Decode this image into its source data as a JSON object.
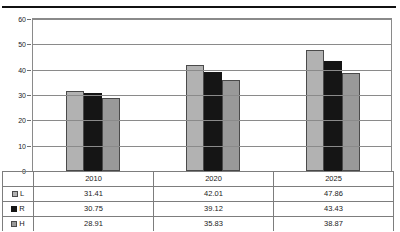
{
  "chart_data": {
    "type": "bar",
    "title": "",
    "subtitle": "",
    "xlabel": "",
    "ylabel": "",
    "categories": [
      "2010",
      "2020",
      "2025"
    ],
    "series": [
      {
        "name": "L",
        "values": [
          31.41,
          42.01,
          47.86
        ],
        "color": "#b2b2b2"
      },
      {
        "name": "R",
        "values": [
          30.75,
          39.12,
          43.43
        ],
        "color": "#151515"
      },
      {
        "name": "H",
        "values": [
          28.91,
          35.83,
          38.87
        ],
        "color": "#999999"
      }
    ],
    "ylim": [
      0,
      60
    ],
    "yticks": [
      0,
      10,
      20,
      30,
      40,
      50,
      60
    ],
    "ytick_labels": [
      "0",
      "10",
      "20",
      "30",
      "40",
      "50",
      "60"
    ],
    "grid": true,
    "grid_axis": "y",
    "legend_position": "table-left",
    "data_table": true
  },
  "table": {
    "row_labels": [
      "L",
      "R",
      "H"
    ],
    "column_headers": [
      "2010",
      "2020",
      "2025"
    ],
    "rows": [
      [
        "31.41",
        "42.01",
        "47.86"
      ],
      [
        "30.75",
        "39.12",
        "43.43"
      ],
      [
        "28.91",
        "35.83",
        "38.87"
      ]
    ]
  }
}
